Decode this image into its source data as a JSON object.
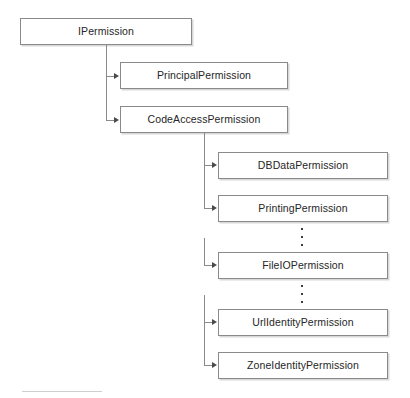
{
  "diagram": {
    "type": "tree-diagram",
    "canvas": {
      "width": 410,
      "height": 398
    },
    "colors": {
      "background": "#ffffff",
      "box_border": "#8a8a8a",
      "box_fill": "#ffffff",
      "box_shadow": "#d8d8d8",
      "connector": "#8a8a8a",
      "arrowhead": "#4a4a4a",
      "text": "#262626",
      "footer_rule": "#cfcfcf",
      "ellipsis_dot": "#3d3d3d"
    },
    "nodes": [
      {
        "id": "ipermission",
        "label": "IPermission",
        "level": 0,
        "x": 20,
        "y": 18,
        "w": 172,
        "h": 27
      },
      {
        "id": "principalpermission",
        "label": "PrincipalPermission",
        "level": 1,
        "x": 120,
        "y": 62,
        "w": 168,
        "h": 27
      },
      {
        "id": "codeaccesspermission",
        "label": "CodeAccessPermission",
        "level": 1,
        "x": 120,
        "y": 106,
        "w": 168,
        "h": 27
      },
      {
        "id": "dbdatapermission",
        "label": "DBDataPermission",
        "level": 2,
        "x": 218,
        "y": 152,
        "w": 170,
        "h": 27
      },
      {
        "id": "printingpermission",
        "label": "PrintingPermission",
        "level": 2,
        "x": 218,
        "y": 195,
        "w": 170,
        "h": 27
      },
      {
        "id": "fileiopermission",
        "label": "FileIOPermission",
        "level": 2,
        "x": 218,
        "y": 252,
        "w": 170,
        "h": 27
      },
      {
        "id": "urlidentitypermission",
        "label": "UrlIdentityPermission",
        "level": 2,
        "x": 218,
        "y": 309,
        "w": 170,
        "h": 27
      },
      {
        "id": "zoneidentitypermission",
        "label": "ZoneIdentityPermission",
        "level": 2,
        "x": 218,
        "y": 352,
        "w": 170,
        "h": 27
      }
    ],
    "edges": [
      {
        "from": "ipermission",
        "to": "principalpermission"
      },
      {
        "from": "ipermission",
        "to": "codeaccesspermission"
      },
      {
        "from": "codeaccesspermission",
        "to": "dbdatapermission"
      },
      {
        "from": "codeaccesspermission",
        "to": "printingpermission"
      },
      {
        "from": "codeaccesspermission",
        "to": "fileiopermission"
      },
      {
        "from": "codeaccesspermission",
        "to": "urlidentitypermission"
      },
      {
        "from": "codeaccesspermission",
        "to": "zoneidentitypermission"
      }
    ],
    "ellipses": [
      {
        "id": "ellipsis-upper",
        "between": [
          "printingpermission",
          "fileiopermission"
        ],
        "dots": 3,
        "x": 301,
        "y": 228,
        "h": 18
      },
      {
        "id": "ellipsis-lower",
        "between": [
          "fileiopermission",
          "urlidentitypermission"
        ],
        "dots": 3,
        "x": 301,
        "y": 285,
        "h": 18
      }
    ],
    "footer_rule": {
      "x": 22,
      "y": 391,
      "w": 80
    }
  }
}
